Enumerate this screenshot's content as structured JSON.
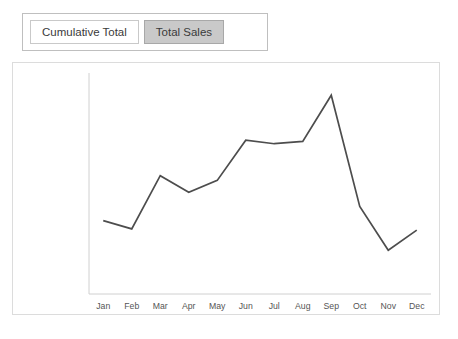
{
  "tabs": [
    {
      "label": "Cumulative Total",
      "state": "inactive"
    },
    {
      "label": "Total Sales",
      "state": "active"
    }
  ],
  "colors": {
    "line": "#4d4d4d",
    "axis": "#d0d0d0",
    "panel_border": "#dcdcdc",
    "tab_active_bg": "#c9c9c9",
    "tab_inactive_bg": "#ffffff",
    "tab_border": "#bfbfbf",
    "tick_text": "#555555"
  },
  "chart_data": {
    "type": "line",
    "title": "",
    "xlabel": "",
    "ylabel": "",
    "grid": false,
    "legend": "none",
    "currency_symbol": "£",
    "categories": [
      "Jan",
      "Feb",
      "Mar",
      "Apr",
      "May",
      "Jun",
      "Jul",
      "Aug",
      "Sep",
      "Oct",
      "Nov",
      "Dec"
    ],
    "series": [
      {
        "name": "Total Sales",
        "values": [
          31000,
          27500,
          50000,
          43000,
          48000,
          65000,
          63500,
          64500,
          84000,
          37000,
          18500,
          27000
        ]
      }
    ],
    "ylim": [
      0,
      90000
    ],
    "ytick_values": [
      90000,
      80000,
      70000,
      60000,
      50000,
      40000,
      30000,
      20000,
      10000,
      0
    ],
    "ytick_labels": [
      "£90,000.00",
      "£80,000.00",
      "£70,000.00",
      "£60,000.00",
      "£50,000.00",
      "£40,000.00",
      "£30,000.00",
      "£20,000.00",
      "£10,000.00",
      "£0.00"
    ]
  }
}
